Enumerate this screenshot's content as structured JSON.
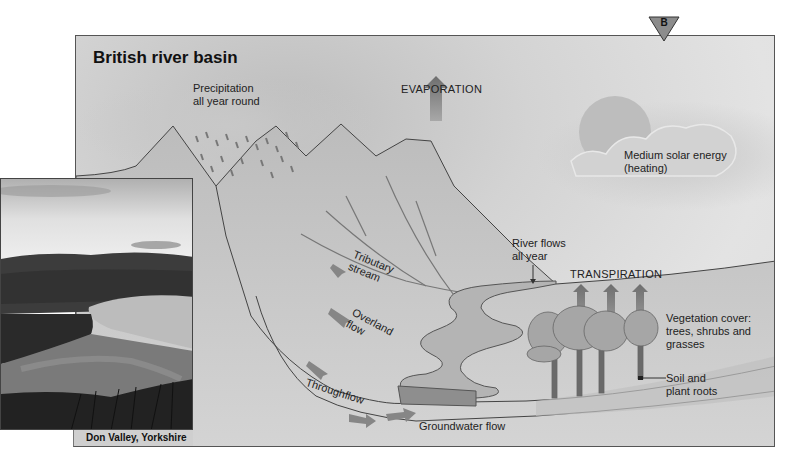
{
  "diagram": {
    "title": "British river basin",
    "badge": "B",
    "labels": {
      "precipitation": [
        "Precipitation",
        "all year round"
      ],
      "evaporation": "EVAPORATION",
      "solar": [
        "Medium solar energy",
        "(heating)"
      ],
      "tributary": [
        "Tributary",
        "stream"
      ],
      "overland": [
        "Overland",
        "flow"
      ],
      "throughflow": "Throughflow",
      "groundwater": "Groundwater flow",
      "river_flows": [
        "River flows",
        "all year"
      ],
      "transpiration": "TRANSPIRATION",
      "vegetation": [
        "Vegetation cover:",
        "trees, shrubs and",
        "grasses"
      ],
      "soil": [
        "Soil and",
        "plant roots"
      ]
    },
    "colors": {
      "sky": "#dcdcdc",
      "mountain": "#c4c4c4",
      "river": "#b4b4b4",
      "arrow": "#7a7a7a",
      "outline": "#444444"
    }
  },
  "photo": {
    "caption": "Don Valley, Yorkshire"
  }
}
